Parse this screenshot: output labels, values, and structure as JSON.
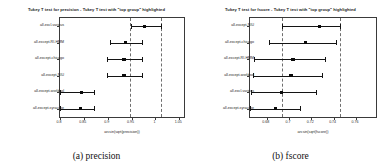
{
  "figure": {
    "panels": [
      {
        "id": "precision",
        "subcaption": "(a) precision",
        "title": "Tukey T test for precision - Tukey T test with \"top group\" highlighted"
      },
      {
        "id": "fscore",
        "subcaption": "(b) fscore",
        "title": "Tukey T test for fscore - Tukey T test with \"top group\" highlighted"
      }
    ]
  },
  "chart_data": [
    {
      "type": "scatter",
      "id": "precision",
      "title": "Tukey T test for precision - Tukey T test with \"top group\" highlighted",
      "xlabel": "arcsin(sqrt(precision))",
      "ylabel": "",
      "xlim": [
        0.8,
        1.06
      ],
      "xticks": [
        0.8,
        0.85,
        0.9,
        0.95,
        1,
        1.05
      ],
      "xticklabels": [
        "0.8",
        "0.85",
        "0.9",
        "0.95",
        "1",
        "1.05"
      ],
      "grid": false,
      "legend": "none",
      "reference_lines": [
        0.947,
        1.012
      ],
      "categories": [
        "all-excl-various",
        "all-except-RI-HMM",
        "all-except-chicago",
        "all-except-NIU",
        "all-except-worldsol",
        "all-except-syracuse"
      ],
      "values": [
        0.977,
        0.938,
        0.934,
        0.934,
        0.845,
        0.843
      ],
      "ci_low": [
        0.949,
        0.905,
        0.898,
        0.898,
        0.8,
        0.8
      ],
      "ci_high": [
        1.012,
        0.972,
        0.971,
        0.971,
        0.872,
        0.871
      ]
    },
    {
      "type": "scatter",
      "id": "fscore",
      "title": "Tukey T test for fscore - Tukey T test with \"top group\" highlighted",
      "xlabel": "arcsin(sqrt(fscore))",
      "ylabel": "",
      "xlim": [
        0.665,
        0.778
      ],
      "xticks": [
        0.68,
        0.7,
        0.72,
        0.74,
        0.76
      ],
      "xticklabels": [
        "0.68",
        "0.7",
        "0.72",
        "0.74",
        "0.76"
      ],
      "grid": false,
      "legend": "none",
      "reference_lines": [
        0.6935,
        0.7455
      ],
      "categories": [
        "all-except-NIU",
        "all-except-chicago",
        "all-except-RI-HMM",
        "all-except-worldsol",
        "all-excl-various",
        "all-except-syracuse"
      ],
      "values": [
        0.7273,
        0.7148,
        0.7035,
        0.7018,
        0.6935,
        0.6877
      ],
      "ci_low": [
        0.6935,
        0.682,
        0.669,
        0.668,
        0.6655,
        0.665
      ],
      "ci_high": [
        0.7455,
        0.742,
        0.732,
        0.73,
        0.724,
        0.71
      ]
    }
  ]
}
